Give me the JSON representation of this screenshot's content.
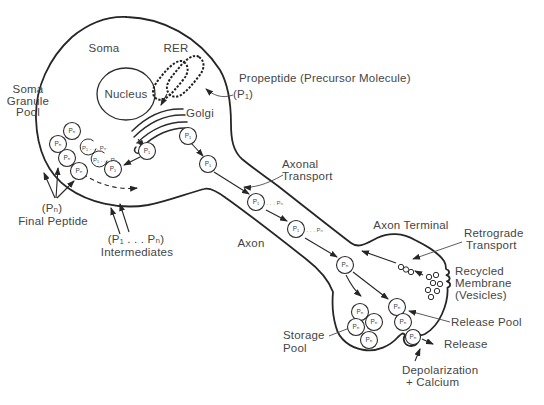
{
  "colors": {
    "ink": "#262626",
    "label_text": "#454545",
    "background": "#ffffff"
  },
  "labels": {
    "soma": "Soma",
    "rer": "RER",
    "nucleus": "Nucleus",
    "soma_granule_pool": [
      "Soma",
      "Granule",
      "Pool"
    ],
    "golgi": "Golgi",
    "propeptide": [
      "Propeptide (Precursor Molecule)",
      "(P₁)"
    ],
    "axonal_transport": [
      "Axonal",
      "Transport"
    ],
    "axon": "Axon",
    "axon_terminal": "Axon Terminal",
    "retrograde_transport": [
      "Retrograde",
      "Transport"
    ],
    "recycled_membrane": [
      "Recycled",
      "Membrane",
      "(Vesicles)"
    ],
    "release_pool": "Release Pool",
    "release": "Release",
    "storage_pool": [
      "Storage",
      "Pool"
    ],
    "depolarization": [
      "Depolarization",
      "+ Calcium"
    ],
    "final_peptide": [
      "(Pₙ)",
      "Final Peptide"
    ],
    "intermediates": [
      "(P₁ . . . Pₙ)",
      "Intermediates"
    ]
  },
  "particles": {
    "soma_granules": [
      {
        "x": 72,
        "y": 131,
        "label": "Pₙ"
      },
      {
        "x": 58,
        "y": 144,
        "label": "Pₙ"
      },
      {
        "x": 67,
        "y": 158,
        "label": "Pₙ"
      },
      {
        "x": 79,
        "y": 171,
        "label": "Pₙ"
      },
      {
        "x": 113,
        "y": 169,
        "label": "P₁"
      },
      {
        "x": 147,
        "y": 151,
        "label": "P₁"
      }
    ],
    "processing_cycles": [
      {
        "x": 88,
        "y": 147,
        "type": "cycle",
        "label": "P₁ . . . Pₙ"
      },
      {
        "x": 99,
        "y": 159,
        "type": "cycle",
        "label": "P₁ . . . Pₙ"
      }
    ],
    "golgi_vesicles": [
      {
        "x": 188,
        "y": 136,
        "label": "P₁"
      },
      {
        "x": 208,
        "y": 164,
        "label": "P₁"
      }
    ],
    "axon_particles": [
      {
        "x": 256,
        "y": 202,
        "label": "P₁",
        "suffix": ". . . Pₙ"
      },
      {
        "x": 296,
        "y": 229,
        "label": "P₁",
        "suffix": ". . . Pₙ"
      },
      {
        "x": 345,
        "y": 265,
        "label": "Pₙ"
      }
    ],
    "storage_pool_granules": [
      {
        "x": 360,
        "y": 312,
        "label": "Pₙ"
      },
      {
        "x": 356,
        "y": 327,
        "label": "Pₙ"
      },
      {
        "x": 374,
        "y": 322,
        "label": "Pₙ"
      },
      {
        "x": 369,
        "y": 340,
        "label": "Pₙ"
      }
    ],
    "release_pool_granules": [
      {
        "x": 397,
        "y": 307,
        "label": "Pₙ"
      },
      {
        "x": 403,
        "y": 322,
        "label": "Pₙ"
      }
    ],
    "release_site_granule": [
      {
        "x": 413,
        "y": 337,
        "label": "Pₙ",
        "r": 7.5
      }
    ],
    "retrograde_vesicles": [
      {
        "x": 401,
        "y": 267
      },
      {
        "x": 406,
        "y": 269.5
      },
      {
        "x": 411,
        "y": 272
      }
    ],
    "recycled_vesicles": [
      {
        "x": 429,
        "y": 277
      },
      {
        "x": 436,
        "y": 275
      },
      {
        "x": 433,
        "y": 283
      },
      {
        "x": 440,
        "y": 284
      },
      {
        "x": 428,
        "y": 290
      },
      {
        "x": 437,
        "y": 291
      },
      {
        "x": 431,
        "y": 297
      }
    ]
  }
}
